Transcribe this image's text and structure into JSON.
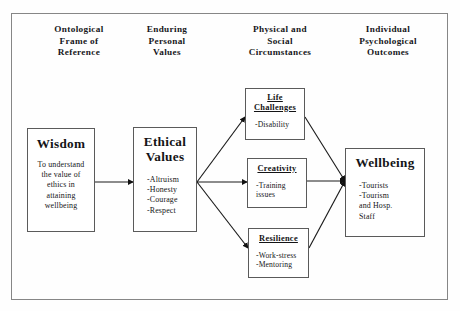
{
  "figure": {
    "kind": "conceptual-flow-diagram",
    "border_color": "#868686",
    "box_border_color": "#5a5a5a",
    "line_color": "#1a1a1a",
    "background": "#ffffff"
  },
  "columns": [
    {
      "id": "col-ontological",
      "lines": [
        "Ontological",
        "Frame of",
        "Reference"
      ]
    },
    {
      "id": "col-enduring",
      "lines": [
        "Enduring",
        "Personal",
        "Values"
      ]
    },
    {
      "id": "col-physical",
      "lines": [
        "Physical and",
        "Social",
        "Circumstances"
      ]
    },
    {
      "id": "col-individual",
      "lines": [
        "Individual",
        "Psychological",
        "Outcomes"
      ]
    }
  ],
  "nodes": {
    "wisdom": {
      "title": "Wisdom",
      "lines": [
        "To understand",
        "the value of",
        "ethics in",
        "attaining",
        "wellbeing"
      ]
    },
    "ethical_values": {
      "title_lines": [
        "Ethical",
        "Values"
      ],
      "lines": [
        "-Altruism",
        "-Honesty",
        "-Courage",
        "-Respect"
      ]
    },
    "life_challenges": {
      "title_lines": [
        "Life",
        "Challenges"
      ],
      "lines": [
        "-Disability"
      ]
    },
    "creativity": {
      "title_lines": [
        "Creativity"
      ],
      "lines": [
        "-Training",
        " issues"
      ]
    },
    "resilience": {
      "title_lines": [
        "Resilience"
      ],
      "lines": [
        "-Work-stress",
        "-Mentoring"
      ]
    },
    "wellbeing": {
      "title": "Wellbeing",
      "lines": [
        "-Tourists",
        "-Tourism",
        " and Hosp.",
        " Staff"
      ]
    }
  },
  "edges": [
    {
      "id": "wisdom-to-ethical",
      "from": "wisdom",
      "to": "ethical_values"
    },
    {
      "id": "ethical-to-life-challenges",
      "from": "ethical_values",
      "to": "life_challenges"
    },
    {
      "id": "ethical-to-creativity",
      "from": "ethical_values",
      "to": "creativity"
    },
    {
      "id": "ethical-to-resilience",
      "from": "ethical_values",
      "to": "resilience"
    },
    {
      "id": "life-challenges-to-wellbeing",
      "from": "life_challenges",
      "to": "wellbeing"
    },
    {
      "id": "creativity-to-wellbeing",
      "from": "creativity",
      "to": "wellbeing"
    },
    {
      "id": "resilience-to-wellbeing",
      "from": "resilience",
      "to": "wellbeing"
    }
  ]
}
